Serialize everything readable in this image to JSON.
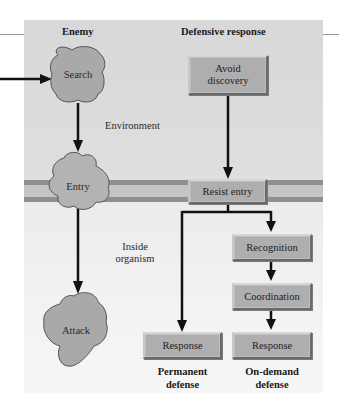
{
  "headers": {
    "enemy": "Enemy",
    "defensive_response": "Defensive response"
  },
  "regions": {
    "environment": "Environment",
    "inside_organism_line1": "Inside",
    "inside_organism_line2": "organism"
  },
  "enemy_stages": [
    {
      "label": "Search"
    },
    {
      "label": "Entry"
    },
    {
      "label": "Attack"
    }
  ],
  "defense_boxes": {
    "avoid_discovery_line1": "Avoid",
    "avoid_discovery_line2": "discovery",
    "resist_entry": "Resist entry",
    "recognition": "Recognition",
    "coordination": "Coordination",
    "permanent_response": "Response",
    "on_demand_response": "Response"
  },
  "footers": {
    "permanent_line1": "Permanent",
    "permanent_line2": "defense",
    "on_demand_line1": "On-demand",
    "on_demand_line2": "defense"
  },
  "colors": {
    "panel": "#dedede",
    "membrane": "#c4c4c4",
    "membrane_stripe": "#8f8f8f",
    "box_fill": "#aeaeae",
    "blob_fill": "#a9a9a9",
    "arrow": "#111111"
  }
}
